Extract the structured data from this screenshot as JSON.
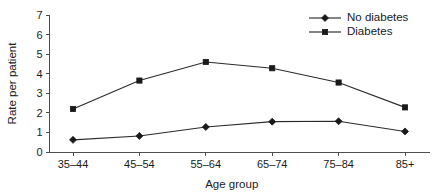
{
  "chart_data": {
    "type": "line",
    "title": "",
    "xlabel": "Age group",
    "ylabel": "Rate per patient",
    "categories": [
      "35–44",
      "45–54",
      "55–64",
      "65–74",
      "75–84",
      "85+"
    ],
    "ylim": [
      0,
      7
    ],
    "yticks": [
      0,
      1,
      2,
      3,
      4,
      5,
      6,
      7
    ],
    "ytick_labels": [
      "0",
      "1",
      "2",
      "3",
      "4",
      "5",
      "6",
      "7"
    ],
    "grid": false,
    "legend_position": "top-right",
    "series": [
      {
        "name": "No diabetes",
        "marker": "diamond",
        "color": "#1a1a1a",
        "values": [
          0.62,
          0.82,
          1.28,
          1.55,
          1.57,
          1.05
        ]
      },
      {
        "name": "Diabetes",
        "marker": "square",
        "color": "#1a1a1a",
        "values": [
          2.2,
          3.65,
          4.6,
          4.28,
          3.55,
          2.28
        ]
      }
    ]
  },
  "legend": {
    "items": [
      {
        "label": "No diabetes",
        "marker": "diamond"
      },
      {
        "label": "Diabetes",
        "marker": "square"
      }
    ]
  },
  "colors": {
    "background": "#ffffff",
    "axis": "#4d4d4d",
    "ink": "#1a1a1a",
    "line": "#2b2b2b"
  }
}
